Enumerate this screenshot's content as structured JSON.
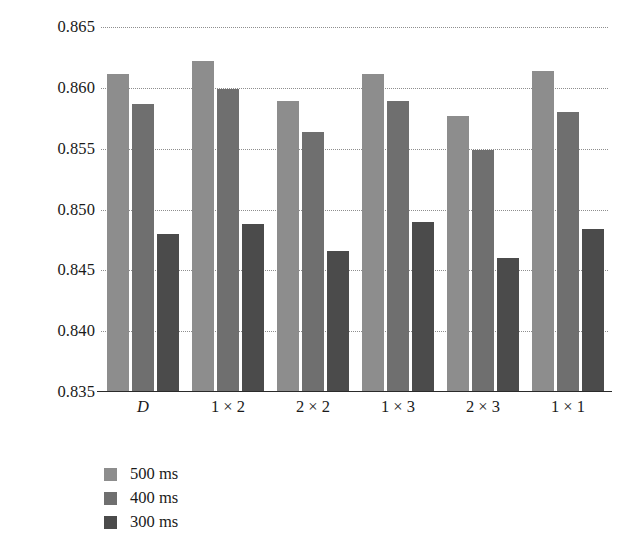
{
  "chart_data": {
    "type": "bar",
    "title": "",
    "subtitle": "",
    "xlabel": "",
    "ylabel": "",
    "grid": true,
    "legend_position": "bottom-left",
    "ylim": [
      0.835,
      0.865
    ],
    "ytick_step": 0.005,
    "ytick_labels": [
      "0.865",
      "0.860",
      "0.855",
      "0.850",
      "0.845",
      "0.840",
      "0.835"
    ],
    "ytick_values": [
      0.865,
      0.86,
      0.855,
      0.85,
      0.845,
      0.84,
      0.835
    ],
    "categories": [
      "D",
      "1 × 2",
      "2 × 2",
      "1 × 3",
      "2 × 3",
      "1 × 1"
    ],
    "series": [
      {
        "name": "500 ms",
        "color": "#8d8d8d",
        "values": [
          0.8611,
          0.8622,
          0.8589,
          0.8611,
          0.8577,
          0.8614
        ]
      },
      {
        "name": "400 ms",
        "color": "#6f6f6f",
        "values": [
          0.8587,
          0.8599,
          0.8564,
          0.8589,
          0.8549,
          0.858
        ]
      },
      {
        "name": "300 ms",
        "color": "#4b4b4b",
        "values": [
          0.848,
          0.8488,
          0.8466,
          0.849,
          0.846,
          0.8484
        ]
      }
    ]
  },
  "legend": {
    "items": [
      {
        "label": "500 ms",
        "color": "#8d8d8d"
      },
      {
        "label": "400 ms",
        "color": "#6f6f6f"
      },
      {
        "label": "300 ms",
        "color": "#4b4b4b"
      }
    ]
  },
  "axis": {
    "gridline_color": "#8e8e8e",
    "axis_color": "#2a2a2a"
  }
}
